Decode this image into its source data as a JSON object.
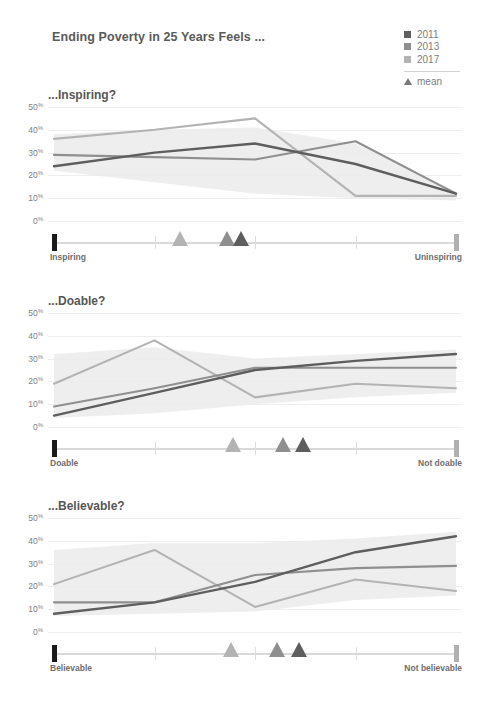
{
  "header": {
    "title": "Ending Poverty in 25 Years Feels ..."
  },
  "legend": {
    "items": [
      {
        "label": "2011",
        "color": "#5e5e5e"
      },
      {
        "label": "2013",
        "color": "#8f8f8f"
      },
      {
        "label": "2017",
        "color": "#b3b3b3"
      }
    ],
    "mean_label": "mean",
    "mean_icon": "triangle-up-icon"
  },
  "chart_data": {
    "type": "line",
    "title": "Ending Poverty in 25 Years Feels ...",
    "xlabel": "",
    "ylabel": "",
    "ylim": [
      0,
      50
    ],
    "yticks": [
      0,
      10,
      20,
      30,
      40,
      50
    ],
    "ytick_labels": [
      "0%",
      "10%",
      "20%",
      "30%",
      "40%",
      "50%"
    ],
    "grid": true,
    "legend_position": "top-right",
    "x": [
      1,
      2,
      3,
      4,
      5
    ],
    "series_colors": {
      "2011": "#5e5e5e",
      "2013": "#8f8f8f",
      "2017": "#b3b3b3"
    },
    "panels": [
      {
        "title": "...Inspiring?",
        "left_label": "Inspiring",
        "right_label": "Uninspiring",
        "series": [
          {
            "name": "2011",
            "values": [
              24,
              30,
              34,
              25,
              12
            ]
          },
          {
            "name": "2013",
            "values": [
              29,
              28,
              27,
              35,
              12
            ]
          },
          {
            "name": "2017",
            "values": [
              36,
              40,
              45,
              11,
              11
            ]
          }
        ],
        "means": [
          {
            "name": "2017",
            "value": 2.25
          },
          {
            "name": "2013",
            "value": 2.72
          },
          {
            "name": "2011",
            "value": 2.86
          }
        ],
        "band": {
          "upper": [
            38,
            40,
            41,
            34,
            13
          ],
          "lower": [
            22,
            17,
            12,
            10,
            9
          ]
        }
      },
      {
        "title": "...Doable?",
        "left_label": "Doable",
        "right_label": "Not doable",
        "series": [
          {
            "name": "2011",
            "values": [
              5,
              15,
              25,
              29,
              32
            ]
          },
          {
            "name": "2013",
            "values": [
              9,
              17,
              26,
              26,
              26
            ]
          },
          {
            "name": "2017",
            "values": [
              19,
              38,
              13,
              19,
              17
            ]
          }
        ],
        "means": [
          {
            "name": "2017",
            "value": 2.78
          },
          {
            "name": "2013",
            "value": 3.28
          },
          {
            "name": "2011",
            "value": 3.48
          }
        ],
        "band": {
          "upper": [
            32,
            35,
            30,
            32,
            34
          ],
          "lower": [
            4,
            6,
            10,
            13,
            15
          ]
        }
      },
      {
        "title": "...Believable?",
        "left_label": "Believable",
        "right_label": "Not believable",
        "series": [
          {
            "name": "2011",
            "values": [
              8,
              13,
              22,
              35,
              42
            ]
          },
          {
            "name": "2013",
            "values": [
              13,
              13,
              25,
              28,
              29
            ]
          },
          {
            "name": "2017",
            "values": [
              21,
              36,
              11,
              23,
              18
            ]
          }
        ],
        "means": [
          {
            "name": "2017",
            "value": 2.76
          },
          {
            "name": "2013",
            "value": 3.22
          },
          {
            "name": "2011",
            "value": 3.44
          }
        ],
        "band": {
          "upper": [
            36,
            39,
            39,
            41,
            44
          ],
          "lower": [
            7,
            8,
            9,
            14,
            16
          ]
        }
      }
    ]
  }
}
